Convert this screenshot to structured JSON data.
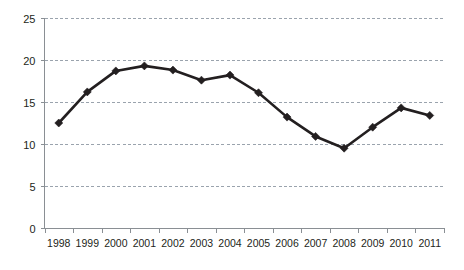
{
  "chart_data": {
    "type": "line",
    "title": "",
    "subtitle": "",
    "xlabel": "",
    "ylabel": "",
    "categories": [
      "1998",
      "1999",
      "2000",
      "2001",
      "2002",
      "2003",
      "2004",
      "2005",
      "2006",
      "2007",
      "2008",
      "2009",
      "2010",
      "2011"
    ],
    "values": [
      12.5,
      16.2,
      18.7,
      19.3,
      18.8,
      17.6,
      18.2,
      16.1,
      13.2,
      10.9,
      9.5,
      12.0,
      14.3,
      13.4
    ],
    "series": [
      {
        "name": "",
        "values": [
          12.5,
          16.2,
          18.7,
          19.3,
          18.8,
          17.6,
          18.2,
          16.1,
          13.2,
          10.9,
          9.5,
          12.0,
          14.3,
          13.4
        ]
      }
    ],
    "ylim": [
      0,
      25
    ],
    "ytick_labels": [
      "0",
      "5",
      "10",
      "15",
      "20",
      "25"
    ],
    "ytick_values": [
      0,
      5,
      10,
      15,
      20,
      25
    ],
    "grid": true,
    "grid_axis": "y",
    "legend": false,
    "legend_position": "none",
    "marker": "diamond",
    "line_color": "#231f20",
    "marker_color": "#231f20",
    "grid_color": "#9aa3ad",
    "axis_color": "#8a8f94",
    "background_color": "#ffffff",
    "annotations": []
  }
}
